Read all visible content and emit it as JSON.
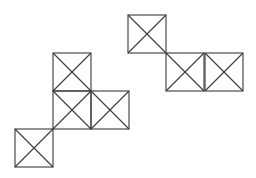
{
  "diagram": {
    "stroke_color": "#3a3a3a",
    "background": "#ffffff",
    "square_size": 38,
    "figures": [
      {
        "name": "left-figure",
        "squares": [
          {
            "x": 53,
            "y": 53
          },
          {
            "x": 53,
            "y": 91
          },
          {
            "x": 91,
            "y": 91
          },
          {
            "x": 15,
            "y": 129
          }
        ]
      },
      {
        "name": "right-figure",
        "squares": [
          {
            "x": 128,
            "y": 15
          },
          {
            "x": 166,
            "y": 53
          },
          {
            "x": 205,
            "y": 53
          }
        ]
      }
    ]
  }
}
